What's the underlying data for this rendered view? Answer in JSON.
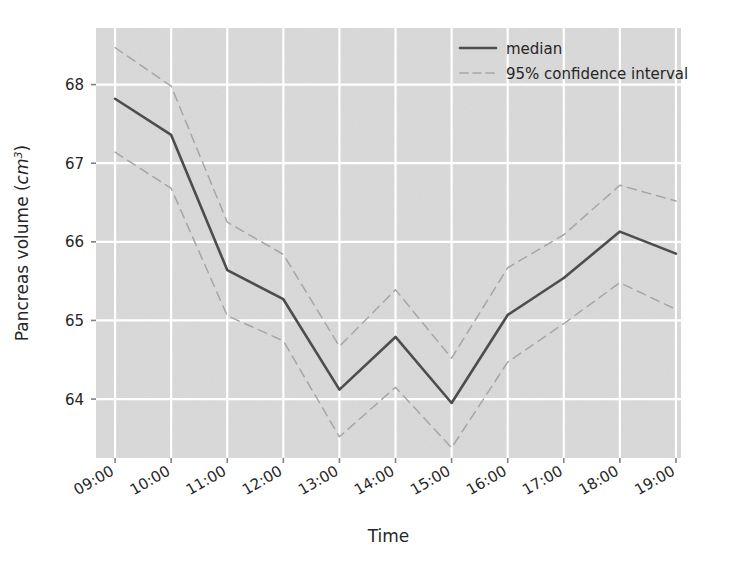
{
  "chart_data": {
    "type": "line",
    "title": "",
    "xlabel": "Time",
    "ylabel": "Pancreas volume (cm³)",
    "ylabel_main": "Pancreas volume (",
    "ylabel_italic": "cm",
    "ylabel_sup": "3",
    "ylabel_tail": ")",
    "x": [
      "09:00",
      "10:00",
      "11:00",
      "12:00",
      "13:00",
      "14:00",
      "15:00",
      "16:00",
      "17:00",
      "18:00",
      "19:00"
    ],
    "xtick_labels": [
      "09:00",
      "10:00",
      "11:00",
      "12:00",
      "13:00",
      "14:00",
      "15:00",
      "16:00",
      "17:00",
      "18:00",
      "19:00"
    ],
    "ytick_labels": [
      "64",
      "65",
      "66",
      "67",
      "68"
    ],
    "yticks": [
      64,
      65,
      66,
      67,
      68
    ],
    "ylim": [
      63.25,
      68.72
    ],
    "xlim": [
      -0.34,
      10.09
    ],
    "grid": true,
    "grid_color": "#ffffff",
    "plot_bgcolor": "#d9d9d9",
    "legend_position": "upper right",
    "series": [
      {
        "name": "median",
        "style": "solid",
        "color": "#4d4d4d",
        "linewidth": 2.6,
        "values": [
          67.82,
          67.36,
          65.64,
          65.27,
          64.12,
          64.79,
          63.95,
          65.07,
          65.54,
          66.13,
          65.85
        ]
      },
      {
        "name": "95% confidence interval upper",
        "style": "dashed",
        "color": "#a6a6a6",
        "linewidth": 1.5,
        "values": [
          68.47,
          67.98,
          66.25,
          65.84,
          64.67,
          65.39,
          64.52,
          65.67,
          66.09,
          66.72,
          66.52
        ]
      },
      {
        "name": "95% confidence interval lower",
        "style": "dashed",
        "color": "#a6a6a6",
        "linewidth": 1.5,
        "values": [
          67.14,
          66.68,
          65.06,
          64.74,
          63.52,
          64.15,
          63.38,
          64.47,
          64.96,
          65.48,
          65.14
        ]
      }
    ],
    "legend": [
      {
        "label": "median",
        "style": "solid",
        "color": "#4d4d4d"
      },
      {
        "label": "95% confidence interval",
        "style": "dashed",
        "color": "#a6a6a6"
      }
    ]
  }
}
